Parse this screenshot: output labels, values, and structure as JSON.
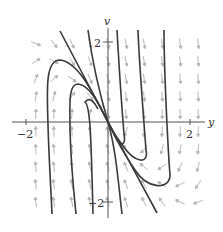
{
  "diagram": {
    "type": "phase-portrait",
    "axes": {
      "horizontal_label": "y",
      "vertical_label": "v",
      "x_ticks": [
        {
          "value": -2,
          "label": "−2"
        },
        {
          "value": 2,
          "label": "2"
        }
      ],
      "y_ticks": [
        {
          "value": 2,
          "label": "2"
        },
        {
          "value": -2,
          "label": "−2"
        }
      ],
      "range": {
        "y": [
          -2.5,
          2.5
        ],
        "v": [
          -2.5,
          2.5
        ]
      }
    },
    "equilibrium": {
      "y": 0,
      "v": 0
    },
    "colors": {
      "solution_curve": "#3a3a3a",
      "direction_field": "#b5b5b5",
      "axis": "#555555"
    },
    "solution_curves": 9,
    "direction_field": "slope arrows on grid"
  }
}
